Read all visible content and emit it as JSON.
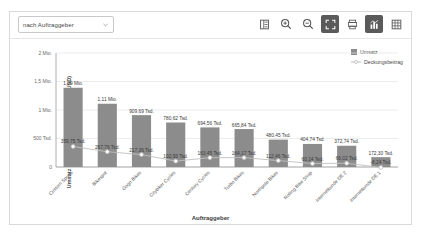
{
  "toolbar": {
    "dropdown_value": "nach Auftraggeber",
    "buttons": [
      {
        "name": "legend-toggle-button",
        "icon": "list-icon",
        "active": false
      },
      {
        "name": "zoom-in-button",
        "icon": "zoom-in-icon",
        "active": false
      },
      {
        "name": "zoom-out-button",
        "icon": "zoom-out-icon",
        "active": false
      },
      {
        "name": "fullscreen-button",
        "icon": "fullscreen-icon",
        "active": true
      },
      {
        "name": "export-button",
        "icon": "printer-icon",
        "active": false
      },
      {
        "name": "chart-view-button",
        "icon": "bar-chart-icon",
        "active": true
      },
      {
        "name": "table-view-button",
        "icon": "grid-icon",
        "active": false
      }
    ]
  },
  "colors": {
    "bar": "#8c8c8c",
    "line": "#bfbfbf",
    "grid": "#e4e4e4",
    "axis": "#9a9a9a",
    "active_button_bg": "#5a5a5a"
  },
  "chart_data": {
    "type": "bar",
    "title": "",
    "xlabel": "Auftraggeber",
    "ylabel": "Umsatz (USD) und Deckungsbeitrag (USD)",
    "ylim": [
      0,
      2000000
    ],
    "ytick_values": [
      0,
      500000,
      1000000,
      1500000,
      2000000
    ],
    "ytick_labels": [
      "0",
      "500 Tsd.",
      "1 Mio.",
      "1,5 Mio.",
      "2 Mio."
    ],
    "grid": true,
    "legend_position": "top-right",
    "categories": [
      "Custom Sports",
      "Bikespot",
      "Gogo Bikes",
      "Citybiker Cycles",
      "Century Cycles",
      "Turbo Bikes",
      "Northpole Bikes",
      "Rolling Bike Shop",
      "Internetkunde DE 2",
      "Internetkunde DE 1"
    ],
    "series": [
      {
        "name": "Umsatz",
        "type": "bar",
        "values": [
          1390000,
          1110000,
          909690,
          780620,
          694560,
          665840,
          480450,
          404740,
          372740,
          172300
        ],
        "labels": [
          "1,39 Mio.",
          "1,11 Mio.",
          "909,69 Tsd.",
          "780,62 Tsd.",
          "694,56 Tsd.",
          "665,84 Tsd.",
          "480,45 Tsd.",
          "404,74 Tsd.",
          "372,74 Tsd.",
          "172,30 Tsd."
        ]
      },
      {
        "name": "Deckungsbeitrag",
        "type": "line",
        "values": [
          359750,
          267760,
          217360,
          102930,
          163450,
          164170,
          112460,
          60140,
          66020,
          -8240
        ],
        "labels": [
          "359,75 Tsd.",
          "267,76 Tsd.",
          "217,36 Tsd.",
          "102,93 Tsd.",
          "163,45 Tsd.",
          "164,17 Tsd.",
          "112,46 Tsd.",
          "60,14 Tsd.",
          "66,02 Tsd.",
          "-8,24 Tsd."
        ]
      }
    ]
  }
}
